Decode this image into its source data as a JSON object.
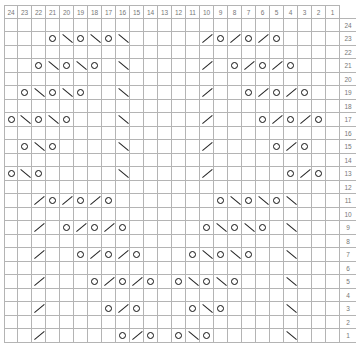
{
  "chart_data": {
    "type": "table",
    "title": "",
    "columns": [
      24,
      23,
      22,
      21,
      20,
      19,
      18,
      17,
      16,
      15,
      14,
      13,
      12,
      11,
      10,
      9,
      8,
      7,
      6,
      5,
      4,
      3,
      2,
      1
    ],
    "row_numbers": [
      24,
      23,
      22,
      21,
      20,
      19,
      18,
      17,
      16,
      15,
      14,
      13,
      12,
      11,
      10,
      9,
      8,
      7,
      6,
      5,
      4,
      3,
      2,
      1
    ],
    "legend": {
      "O": "yarn over",
      "/": "k2tog (right-leaning decrease)",
      "\\": "ssk (left-leaning decrease)"
    },
    "symbols_by_row": {
      "24": {},
      "23": {
        "21": "O",
        "20": "\\",
        "19": "O",
        "18": "\\",
        "17": "O",
        "16": "\\",
        "10": "/",
        "9": "O",
        "8": "/",
        "7": "O",
        "6": "/",
        "5": "O"
      },
      "22": {},
      "21": {
        "22": "O",
        "21": "\\",
        "20": "O",
        "19": "\\",
        "18": "O",
        "16": "\\",
        "10": "/",
        "8": "O",
        "7": "/",
        "6": "O",
        "5": "/",
        "4": "O"
      },
      "20": {},
      "19": {
        "23": "O",
        "22": "\\",
        "21": "O",
        "20": "\\",
        "19": "O",
        "16": "\\",
        "10": "/",
        "7": "O",
        "6": "/",
        "5": "O",
        "4": "/",
        "3": "O"
      },
      "18": {},
      "17": {
        "24": "O",
        "23": "\\",
        "22": "O",
        "21": "\\",
        "20": "O",
        "16": "\\",
        "10": "/",
        "6": "O",
        "5": "/",
        "4": "O",
        "3": "/",
        "2": "O"
      },
      "16": {},
      "15": {
        "23": "O",
        "22": "\\",
        "21": "O",
        "16": "\\",
        "10": "/",
        "5": "O",
        "4": "/",
        "3": "O"
      },
      "14": {},
      "13": {
        "24": "O",
        "23": "\\",
        "22": "O",
        "16": "\\",
        "10": "/",
        "4": "O",
        "3": "/",
        "2": "O"
      },
      "12": {},
      "11": {
        "22": "/",
        "21": "O",
        "20": "/",
        "19": "O",
        "18": "/",
        "17": "O",
        "9": "O",
        "8": "\\",
        "7": "O",
        "6": "\\",
        "5": "O",
        "4": "\\"
      },
      "10": {},
      "9": {
        "22": "/",
        "20": "O",
        "19": "/",
        "18": "O",
        "17": "/",
        "16": "O",
        "10": "O",
        "9": "\\",
        "8": "O",
        "7": "\\",
        "6": "O",
        "4": "\\"
      },
      "8": {},
      "7": {
        "22": "/",
        "19": "O",
        "18": "/",
        "17": "O",
        "16": "/",
        "15": "O",
        "11": "O",
        "10": "\\",
        "9": "O",
        "8": "\\",
        "7": "O",
        "4": "\\"
      },
      "6": {},
      "5": {
        "22": "/",
        "18": "O",
        "17": "/",
        "16": "O",
        "15": "/",
        "14": "O",
        "12": "O",
        "11": "\\",
        "10": "O",
        "9": "\\",
        "8": "O",
        "4": "\\"
      },
      "4": {},
      "3": {
        "22": "/",
        "17": "O",
        "16": "/",
        "15": "O",
        "11": "O",
        "10": "\\",
        "9": "O",
        "4": "\\"
      },
      "2": {},
      "1": {
        "22": "/",
        "16": "O",
        "15": "/",
        "14": "O",
        "12": "O",
        "11": "\\",
        "10": "O",
        "4": "\\"
      }
    }
  },
  "colors": {
    "grid": "#b4b4b4",
    "label": "#777777",
    "symbol": "#111111"
  }
}
